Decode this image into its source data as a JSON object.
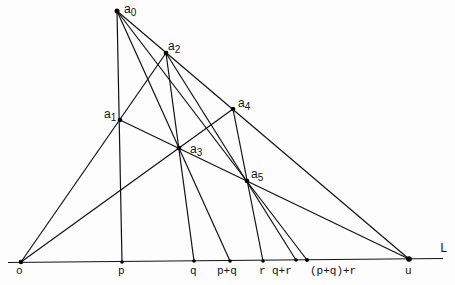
{
  "diagram": {
    "line_label": "L",
    "points": {
      "a0": {
        "label": "a",
        "sub": "0",
        "x": 117,
        "y": 11
      },
      "a1": {
        "label": "a",
        "sub": "1",
        "x": 120,
        "y": 120
      },
      "a2": {
        "label": "a",
        "sub": "2",
        "x": 166,
        "y": 53
      },
      "a3": {
        "label": "a",
        "sub": "3",
        "x": 179,
        "y": 148
      },
      "a4": {
        "label": "a",
        "sub": "4",
        "x": 233,
        "y": 109
      },
      "a5": {
        "label": "a",
        "sub": "5",
        "x": 247,
        "y": 181
      }
    },
    "axis_points": [
      {
        "id": "o",
        "label": "o",
        "x": 21,
        "y": 262
      },
      {
        "id": "p",
        "label": "p",
        "x": 122,
        "y": 262
      },
      {
        "id": "q",
        "label": "q",
        "x": 194,
        "y": 261
      },
      {
        "id": "pq",
        "label": "p+q",
        "x": 230,
        "y": 261
      },
      {
        "id": "r",
        "label": "r",
        "x": 263,
        "y": 261
      },
      {
        "id": "qr",
        "label": "q+r",
        "x": 296,
        "y": 260
      },
      {
        "id": "pqr",
        "label": "(p+q)+r",
        "x": 307,
        "y": 260
      },
      {
        "id": "u",
        "label": "u",
        "x": 409,
        "y": 259
      }
    ],
    "segments": [
      [
        "o",
        "a2"
      ],
      [
        "o",
        "a4"
      ],
      [
        "a0",
        "p"
      ],
      [
        "a0",
        "u"
      ],
      [
        "a1",
        "u"
      ],
      [
        "a0",
        "pq"
      ],
      [
        "a0",
        "pqr"
      ],
      [
        "a2",
        "q"
      ],
      [
        "a2",
        "qr"
      ],
      [
        "a4",
        "r"
      ]
    ]
  }
}
